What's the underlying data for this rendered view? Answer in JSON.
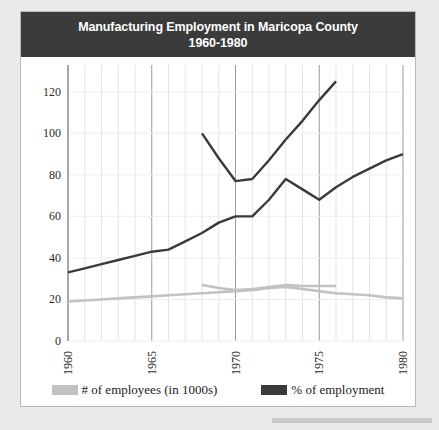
{
  "chart_data": {
    "type": "line",
    "title": "Manufacturing Employment in Maricopa County",
    "subtitle": "1960-1980",
    "xlabel": "",
    "ylabel": "",
    "xlim": [
      1960,
      1980
    ],
    "ylim": [
      0,
      130
    ],
    "yticks": [
      0,
      20,
      40,
      60,
      80,
      100,
      120
    ],
    "xticks": [
      1960,
      1965,
      1970,
      1975,
      1980
    ],
    "grid": true,
    "legend_position": "bottom",
    "series": [
      {
        "name": "# of employees (in 1000s)",
        "color": "#c2c2c2",
        "x": [
          1960,
          1961,
          1962,
          1963,
          1964,
          1965,
          1966,
          1967,
          1968,
          1969,
          1970,
          1971,
          1972,
          1973,
          1974,
          1975,
          1976,
          1977,
          1978,
          1979,
          1980
        ],
        "values": [
          19,
          19.5,
          20,
          20.5,
          21,
          21.5,
          22,
          22.5,
          23,
          23.5,
          24,
          24.5,
          25.5,
          26,
          25,
          24,
          23,
          22.5,
          22,
          21,
          20.5
        ]
      },
      {
        "name": "# of employees (in 1000s) - alt",
        "color": "#c2c2c2",
        "x": [
          1968,
          1969,
          1970,
          1971,
          1972,
          1973,
          1974,
          1975,
          1976
        ],
        "values": [
          27,
          25.5,
          24.5,
          25,
          26,
          27,
          26.5,
          26.5,
          26.5
        ]
      },
      {
        "name": "% of employment",
        "color": "#3a3a3a",
        "x": [
          1960,
          1961,
          1962,
          1963,
          1964,
          1965,
          1966,
          1967,
          1968,
          1969,
          1970,
          1971,
          1972,
          1973,
          1974,
          1975,
          1976,
          1977,
          1978,
          1979,
          1980
        ],
        "values": [
          33,
          35,
          37,
          39,
          41,
          43,
          44,
          48,
          52,
          57,
          60,
          60,
          68,
          78,
          73,
          68,
          74,
          79,
          83,
          87,
          90
        ]
      },
      {
        "name": "% of employment - alt",
        "color": "#3a3a3a",
        "x": [
          1968,
          1969,
          1970,
          1971,
          1972,
          1973,
          1974,
          1975,
          1976
        ],
        "values": [
          100,
          88,
          77,
          78,
          87,
          97,
          106,
          116,
          125
        ]
      }
    ]
  },
  "legend": {
    "items": [
      {
        "label": "# of employees (in 1000s)",
        "color": "#c2c2c2"
      },
      {
        "label": "% of employment",
        "color": "#3a3a3a"
      }
    ]
  }
}
